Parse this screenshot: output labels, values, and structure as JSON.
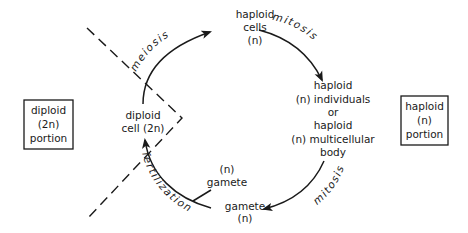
{
  "diagram": {
    "portions": {
      "diploid": {
        "lines": [
          "diploid",
          "(2n)",
          "portion"
        ]
      },
      "haploid": {
        "lines": [
          "haploid",
          "(n)",
          "portion"
        ]
      }
    },
    "nodes": {
      "haploid_cells": {
        "lines": [
          "haploid",
          "cells",
          "(n)"
        ]
      },
      "haploid_body": {
        "lines": [
          "haploid",
          "(n) individuals",
          "or",
          "haploid",
          "(n) multicellular",
          "body"
        ]
      },
      "gamete_bottom": {
        "lines": [
          "gamete",
          "(n)"
        ]
      },
      "gamete_top": {
        "lines": [
          "(n)",
          "gamete"
        ]
      },
      "diploid_cell": {
        "lines": [
          "diploid",
          "cell (2n)"
        ]
      }
    },
    "processes": {
      "meiosis": "meiosis",
      "mitosis_1": "mitosis",
      "mitosis_2": "mitosis",
      "fertilization": "fertilization"
    },
    "edges": [
      {
        "from": "diploid_cell",
        "to": "haploid_cells",
        "label": "meiosis"
      },
      {
        "from": "haploid_cells",
        "to": "haploid_body",
        "label": "mitosis"
      },
      {
        "from": "haploid_body",
        "to": "gamete_bottom",
        "label": "mitosis"
      },
      {
        "from": "gamete_bottom",
        "to": "diploid_cell",
        "label": "fertilization"
      }
    ],
    "colors": {
      "ink": "#1a1a1a",
      "background": "#ffffff"
    }
  }
}
